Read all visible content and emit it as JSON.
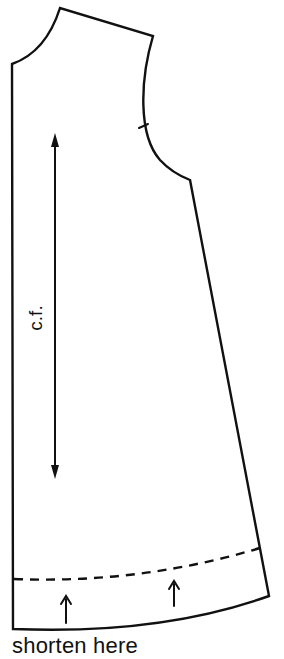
{
  "diagram": {
    "pieces": [
      "front-dress-pattern"
    ],
    "labels": {
      "center_front": "c.f.",
      "caption": "shorten here"
    },
    "markings": {
      "grainline": "double-headed arrow",
      "shorten_line": "dashed line",
      "shorten_arrows": 2,
      "armhole_notch": 1
    },
    "colors": {
      "line": "#111111",
      "background": "#ffffff"
    }
  }
}
